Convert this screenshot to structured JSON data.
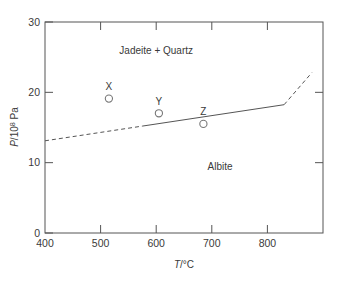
{
  "chart_data": {
    "type": "scatter",
    "title": "",
    "xlabel": "T/°C",
    "ylabel": "P/10⁸ Pa",
    "xlim": [
      400,
      900
    ],
    "ylim": [
      0,
      30
    ],
    "xticks": [
      400,
      500,
      600,
      700,
      800
    ],
    "yticks": [
      0,
      10,
      20,
      30
    ],
    "grid": false,
    "legend": false,
    "axis_color": "#555555",
    "line_color": "#555555",
    "marker_color": "#777777",
    "text_color": "#3a3a3a",
    "xtick_labels": [
      "400",
      "500",
      "600",
      "700",
      "800"
    ],
    "ytick_labels": [
      "0",
      "10",
      "20",
      "30"
    ],
    "boundary_line": {
      "name": "Albite = Jadeite + Quartz equilibrium",
      "x": [
        400,
        880
      ],
      "y": [
        13.1,
        22.8
      ],
      "solid_segment_x": [
        575,
        830
      ],
      "dashed_left": true,
      "dashed_right": true,
      "style": "solid-with-dashed-extensions"
    },
    "points": [
      {
        "label": "X",
        "x": 515,
        "y": 19.1
      },
      {
        "label": "Y",
        "x": 605,
        "y": 17.0
      },
      {
        "label": "Z",
        "x": 685,
        "y": 15.5
      }
    ],
    "annotations": [
      {
        "text": "Jadeite + Quartz",
        "x": 600,
        "y": 25.6
      },
      {
        "text": "Albite",
        "x": 715,
        "y": 10.9
      }
    ]
  }
}
